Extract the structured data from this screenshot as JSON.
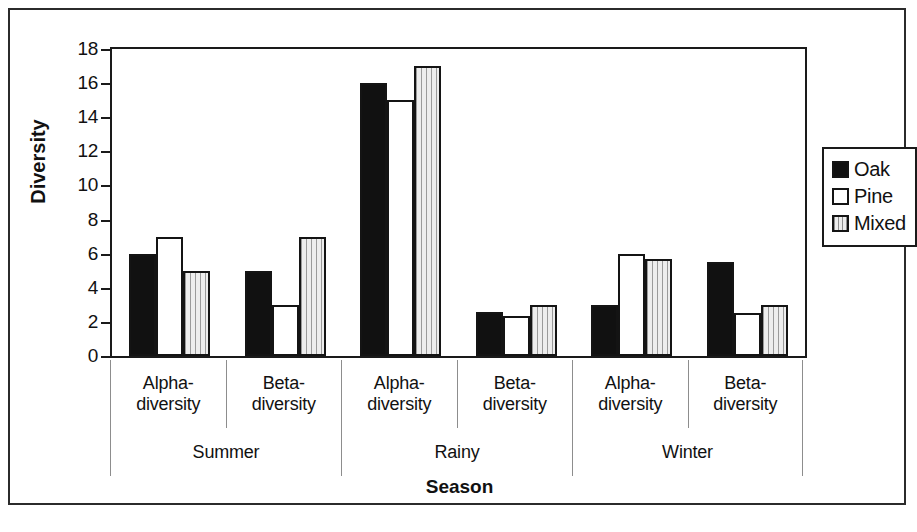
{
  "chart_data": {
    "type": "bar",
    "title": "",
    "xlabel": "Season",
    "ylabel": "Diversity",
    "ylim": [
      0,
      18
    ],
    "ytick_step": 2,
    "yticks": [
      0,
      2,
      4,
      6,
      8,
      10,
      12,
      14,
      16,
      18
    ],
    "grid": false,
    "legend_position": "right",
    "group_labels": [
      "Summer",
      "Rainy",
      "Winter"
    ],
    "categories": [
      "Alpha-diversity",
      "Beta-diversity",
      "Alpha-diversity",
      "Beta-diversity",
      "Alpha-diversity",
      "Beta-diversity"
    ],
    "category_lines": [
      [
        "Alpha-",
        "diversity"
      ],
      [
        "Beta-",
        "diversity"
      ],
      [
        "Alpha-",
        "diversity"
      ],
      [
        "Beta-",
        "diversity"
      ],
      [
        "Alpha-",
        "diversity"
      ],
      [
        "Beta-",
        "diversity"
      ]
    ],
    "series": [
      {
        "name": "Oak",
        "fill": "solid-black",
        "color": "#111111",
        "values": [
          6,
          5,
          16,
          2.6,
          3,
          5.5
        ]
      },
      {
        "name": "Pine",
        "fill": "white-outline",
        "color": "#ffffff",
        "values": [
          7,
          3,
          15,
          2.35,
          6,
          2.5
        ]
      },
      {
        "name": "Mixed",
        "fill": "vertical-stripes",
        "color": "#e2e2e2",
        "values": [
          5,
          7,
          17,
          3,
          5.7,
          3
        ]
      }
    ]
  },
  "legend": {
    "items": [
      {
        "label": "Oak",
        "swatch": "oak"
      },
      {
        "label": "Pine",
        "swatch": "pine"
      },
      {
        "label": "Mixed",
        "swatch": "mixed"
      }
    ]
  },
  "axes": {
    "y_title": "Diversity",
    "x_title": "Season",
    "y_tick_labels": [
      "18",
      "16",
      "14",
      "12",
      "10",
      "8",
      "6",
      "4",
      "2",
      "0"
    ]
  }
}
